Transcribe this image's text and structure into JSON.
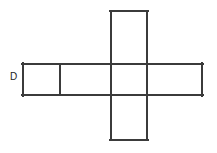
{
  "figure": {
    "type": "geometric-net",
    "canvas": {
      "width": 217,
      "height": 153
    },
    "background_color": "#ffffff",
    "line_color": "#3b3b3b",
    "line_width": 2,
    "face_fill": "#ffffff"
  },
  "labels": [
    {
      "id": "label-d",
      "text": "D",
      "x": 10,
      "y": 72,
      "font_size": 10,
      "color": "#1d1d1d",
      "position_note": "left of the leftmost face, outside the figure"
    }
  ],
  "geometry": {
    "horizontal_band": {
      "x": 22,
      "y": 63,
      "width": 181,
      "height": 33,
      "note": "long horizontal strip spanning the full width of the cross"
    },
    "vertical_band": {
      "x": 110,
      "y": 10,
      "width": 38,
      "height": 131,
      "note": "vertical strip crossing the horizontal band"
    },
    "internal_divider_x": 60,
    "faces": [
      {
        "id": "face-left-small",
        "x": 22,
        "y": 63,
        "width": 38,
        "height": 33
      },
      {
        "id": "face-left-wide",
        "x": 60,
        "y": 63,
        "width": 50,
        "height": 33
      },
      {
        "id": "face-center",
        "x": 110,
        "y": 63,
        "width": 38,
        "height": 33
      },
      {
        "id": "face-right",
        "x": 148,
        "y": 63,
        "width": 55,
        "height": 33
      },
      {
        "id": "face-top",
        "x": 110,
        "y": 10,
        "width": 38,
        "height": 53
      },
      {
        "id": "face-bottom",
        "x": 110,
        "y": 96,
        "width": 38,
        "height": 45
      }
    ],
    "segments": [
      {
        "id": "seg-band-top-left",
        "x1": 22,
        "y1": 63,
        "x2": 110,
        "y2": 63
      },
      {
        "id": "seg-band-top-center",
        "x1": 110,
        "y1": 63,
        "x2": 148,
        "y2": 63
      },
      {
        "id": "seg-band-top-right",
        "x1": 148,
        "y1": 63,
        "x2": 203,
        "y2": 63
      },
      {
        "id": "seg-band-bottom-left",
        "x1": 22,
        "y1": 96,
        "x2": 110,
        "y2": 96
      },
      {
        "id": "seg-band-bottom-ctr",
        "x1": 110,
        "y1": 96,
        "x2": 148,
        "y2": 96
      },
      {
        "id": "seg-band-bottom-rgt",
        "x1": 148,
        "y1": 96,
        "x2": 203,
        "y2": 96
      },
      {
        "id": "seg-band-left-end",
        "x1": 22,
        "y1": 63,
        "x2": 22,
        "y2": 96
      },
      {
        "id": "seg-band-right-end",
        "x1": 203,
        "y1": 63,
        "x2": 203,
        "y2": 96
      },
      {
        "id": "seg-internal-divider",
        "x1": 60,
        "y1": 63,
        "x2": 60,
        "y2": 96
      },
      {
        "id": "seg-col-left",
        "x1": 110,
        "y1": 10,
        "x2": 110,
        "y2": 141
      },
      {
        "id": "seg-col-right",
        "x1": 148,
        "y1": 10,
        "x2": 148,
        "y2": 141
      },
      {
        "id": "seg-col-top",
        "x1": 110,
        "y1": 10,
        "x2": 148,
        "y2": 10
      },
      {
        "id": "seg-col-bottom",
        "x1": 110,
        "y1": 141,
        "x2": 148,
        "y2": 141
      }
    ]
  }
}
